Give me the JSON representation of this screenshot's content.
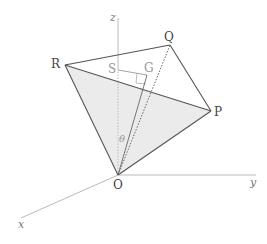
{
  "diagram": {
    "axes": {
      "x": {
        "label": "x"
      },
      "y": {
        "label": "y"
      },
      "z": {
        "label": "z"
      }
    },
    "points": {
      "O": {
        "label": "O"
      },
      "P": {
        "label": "P"
      },
      "Q": {
        "label": "Q"
      },
      "R": {
        "label": "R"
      },
      "S": {
        "label": "S"
      },
      "G": {
        "label": "G"
      }
    },
    "angle": {
      "label": "θ"
    },
    "colors": {
      "edge": "#555555",
      "face_fill": "#ebebeb",
      "axis": "#bbbbbb",
      "light_label": "#999999"
    }
  }
}
